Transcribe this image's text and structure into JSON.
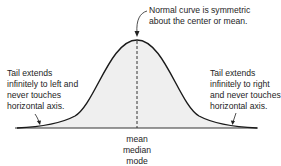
{
  "diagram": {
    "annotations": {
      "top": {
        "lines": [
          "Normal curve is symmetric",
          "about the center or mean."
        ]
      },
      "left_tail": {
        "lines": [
          "Tail extends",
          "infinitely to left and",
          "never touches",
          "horizontal axis."
        ]
      },
      "right_tail": {
        "lines": [
          "Tail extends",
          "infinitely to right",
          "and never touches",
          "horizontal axis."
        ]
      }
    },
    "center_labels": [
      "mean",
      "median",
      "mode"
    ],
    "colors": {
      "curve": "#1a1a1a",
      "fill": "#efefef",
      "axis": "#2a2a2a",
      "center_line": "#2a2a2a"
    }
  }
}
